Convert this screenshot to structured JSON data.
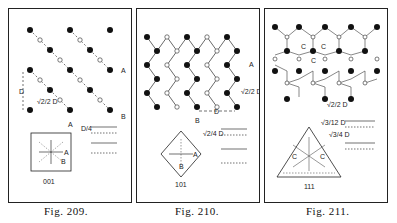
{
  "figures": [
    {
      "caption_prefix": "Fig.",
      "caption_number": "209.",
      "face_label": "001",
      "labels": {
        "A": "A",
        "B": "B",
        "D": "D",
        "sqrt2_over2_D": "√2/2 D",
        "D_over_4": "D/4"
      }
    },
    {
      "caption_prefix": "Fig.",
      "caption_number": "210.",
      "face_label": "101",
      "labels": {
        "A": "A",
        "B": "B",
        "D": "D",
        "sqrt2_over2_D": "√2/2 D",
        "sqrt2_over4_D": "√2/4 D"
      }
    },
    {
      "caption_prefix": "Fig.",
      "caption_number": "211.",
      "face_label": "111",
      "labels": {
        "C": "C",
        "sqrt2_over2_D": "√2/2 D",
        "sqrt3_over12_D": "√3/12 D",
        "sqrt3_over4_D": "√3/4 D"
      }
    }
  ]
}
